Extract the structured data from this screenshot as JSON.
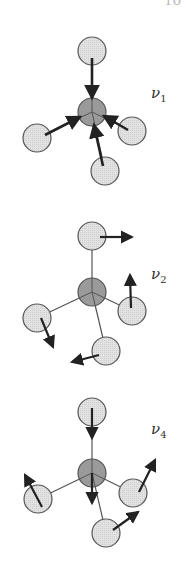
{
  "header_fragment": "ro",
  "panels": [
    {
      "mode": "ν",
      "index": "1",
      "label_pos": [
        151,
        84
      ],
      "center": [
        92,
        112
      ],
      "ligands": [
        [
          92,
          51
        ],
        [
          37,
          138
        ],
        [
          132,
          131
        ],
        [
          105,
          171
        ]
      ],
      "arrows": [
        [
          [
            92,
            58
          ],
          [
            92,
            98
          ]
        ],
        [
          [
            45,
            135
          ],
          [
            80,
            117
          ]
        ],
        [
          [
            128,
            130
          ],
          [
            104,
            116
          ]
        ],
        [
          [
            103,
            166
          ],
          [
            94,
            125
          ]
        ]
      ],
      "bonds_drawn_as_arrows": true
    },
    {
      "mode": "ν",
      "index": "2",
      "label_pos": [
        151,
        265
      ],
      "center": [
        92,
        292
      ],
      "ligands": [
        [
          92,
          236
        ],
        [
          37,
          318
        ],
        [
          132,
          311
        ],
        [
          106,
          351
        ]
      ],
      "arrows": [
        [
          [
            100,
            237
          ],
          [
            132,
            237
          ]
        ],
        [
          [
            131,
            308
          ],
          [
            130,
            275
          ]
        ],
        [
          [
            41,
            318
          ],
          [
            53,
            347
          ]
        ],
        [
          [
            99,
            355
          ],
          [
            72,
            362
          ]
        ]
      ],
      "bonds_drawn_as_arrows": false
    },
    {
      "mode": "ν",
      "index": "4",
      "label_pos": [
        151,
        420
      ],
      "center": [
        92,
        473
      ],
      "ligands": [
        [
          92,
          412
        ],
        [
          38,
          499
        ],
        [
          133,
          493
        ],
        [
          106,
          533
        ]
      ],
      "arrows": [
        [
          [
            92,
            408
          ],
          [
            92,
            438
          ]
        ],
        [
          [
            92,
            473
          ],
          [
            92,
            503
          ]
        ],
        [
          [
            42,
            507
          ],
          [
            25,
            475
          ]
        ],
        [
          [
            139,
            492
          ],
          [
            155,
            460
          ]
        ],
        [
          [
            113,
            530
          ],
          [
            138,
            512
          ]
        ]
      ],
      "bonds_drawn_as_arrows": false
    }
  ],
  "style": {
    "ligand_fill": "#e2e2e2",
    "center_fill": "#9a9a9a",
    "stroke": "#555555",
    "arrow": "#222222",
    "atom_radius": 14
  }
}
